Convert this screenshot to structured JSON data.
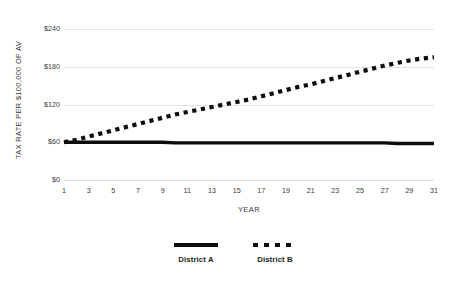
{
  "chart_data": {
    "type": "line",
    "title": "",
    "xlabel": "YEAR",
    "ylabel": "TAX RATE PER $100,000 OF AV",
    "xlim": [
      1,
      31
    ],
    "ylim": [
      0,
      240
    ],
    "grid": true,
    "legend_position": "bottom",
    "x": [
      1,
      2,
      3,
      4,
      5,
      6,
      7,
      8,
      9,
      10,
      11,
      12,
      13,
      14,
      15,
      16,
      17,
      18,
      19,
      20,
      21,
      22,
      23,
      24,
      25,
      26,
      27,
      28,
      29,
      30,
      31
    ],
    "xticks": [
      "1",
      "3",
      "5",
      "7",
      "9",
      "11",
      "13",
      "15",
      "17",
      "19",
      "21",
      "23",
      "25",
      "27",
      "29",
      "31"
    ],
    "xtick_values": [
      1,
      3,
      5,
      7,
      9,
      11,
      13,
      15,
      17,
      19,
      21,
      23,
      25,
      27,
      29,
      31
    ],
    "yticks": [
      "$0",
      "$60",
      "$120",
      "$180",
      "$240"
    ],
    "ytick_values": [
      0,
      60,
      120,
      180,
      240
    ],
    "series": [
      {
        "name": "District A",
        "style": "solid",
        "color": "#0d0d0d",
        "values": [
          60,
          60,
          60,
          60,
          60,
          60,
          60,
          60,
          60,
          59,
          59,
          59,
          59,
          59,
          59,
          59,
          59,
          59,
          59,
          59,
          59,
          59,
          59,
          59,
          59,
          59,
          59,
          58,
          58,
          58,
          58
        ]
      },
      {
        "name": "District B",
        "style": "dotted",
        "color": "#0d0d0d",
        "values": [
          60,
          64,
          69,
          74,
          79,
          84,
          89,
          94,
          99,
          104,
          108,
          112,
          116,
          120,
          124,
          128,
          133,
          138,
          143,
          148,
          152,
          157,
          162,
          167,
          172,
          177,
          182,
          186,
          190,
          193,
          195
        ]
      }
    ]
  },
  "legend": {
    "entries": [
      {
        "label": "District A",
        "style": "solid"
      },
      {
        "label": "District B",
        "style": "dotted"
      }
    ]
  },
  "colors": {
    "ink": "#0d0d0d",
    "grid": "#e3e3e3",
    "text": "#3b3b3b",
    "background": "#ffffff"
  }
}
